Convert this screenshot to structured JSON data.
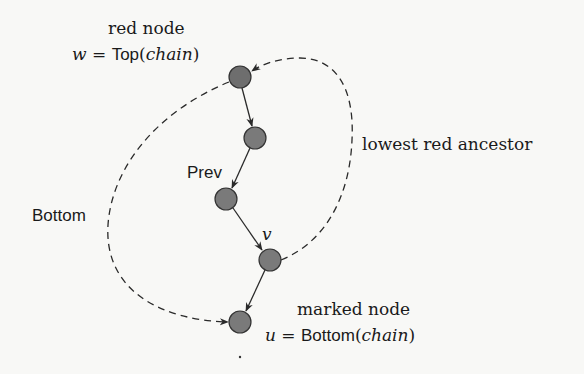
{
  "diagram": {
    "colors": {
      "node_fill": "#6e6e6e",
      "node_stroke": "#333333",
      "edge": "#2a2a2a",
      "background": "#f8f8f6",
      "text": "#1a1a1a"
    },
    "nodes": [
      {
        "id": "n1",
        "cx": 240,
        "cy": 77,
        "r": 11,
        "role": "red node (Top)"
      },
      {
        "id": "n2",
        "cx": 255,
        "cy": 138,
        "r": 11,
        "role": "chain node"
      },
      {
        "id": "n3",
        "cx": 226,
        "cy": 199,
        "r": 11,
        "role": "Prev"
      },
      {
        "id": "n4",
        "cx": 270,
        "cy": 260,
        "r": 11,
        "role": "v"
      },
      {
        "id": "n5",
        "cx": 240,
        "cy": 322,
        "r": 11,
        "role": "marked node (Bottom)"
      }
    ],
    "edges": [
      {
        "from": "n1",
        "to": "n2",
        "style": "solid"
      },
      {
        "from": "n2",
        "to": "n3",
        "style": "solid"
      },
      {
        "from": "n3",
        "to": "n4",
        "style": "solid"
      },
      {
        "from": "n4",
        "to": "n5",
        "style": "solid"
      },
      {
        "from": "n4",
        "to": "n1",
        "style": "dashed",
        "label": "lowest red ancestor"
      },
      {
        "from": "n1",
        "to": "n5",
        "style": "dashed",
        "label": "Bottom"
      }
    ],
    "labels": {
      "red_node": "red node",
      "top_lhs": "w",
      "top_eq": " = ",
      "top_fn": "Top",
      "top_arg_open": "(",
      "top_arg": "chain",
      "top_arg_close": ")",
      "lowest_red_ancestor": "lowest red ancestor",
      "prev": "Prev",
      "bottom": "Bottom",
      "v": "v",
      "marked_node": "marked node",
      "bot_lhs": "u",
      "bot_eq": " = ",
      "bot_fn": "Bottom",
      "bot_arg_open": "(",
      "bot_arg": "chain",
      "bot_arg_close": ")"
    }
  }
}
